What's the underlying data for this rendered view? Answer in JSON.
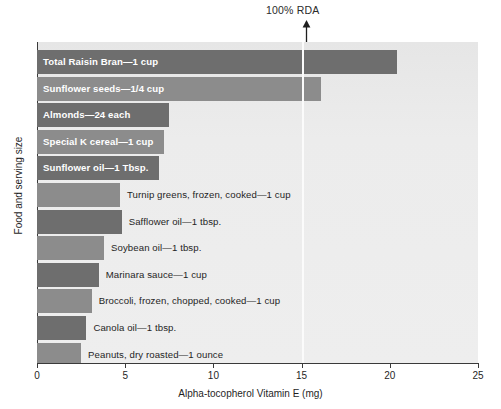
{
  "chart_data": {
    "type": "bar",
    "orientation": "horizontal",
    "title": "",
    "xlabel": "Alpha-tocopherol Vitamin E (mg)",
    "ylabel": "Food and serving size",
    "xlim": [
      0,
      25
    ],
    "xticks": [
      0,
      5,
      10,
      15,
      20,
      25
    ],
    "xtick_labels": [
      "0",
      "5",
      "10",
      "15",
      "20",
      "25"
    ],
    "grid": false,
    "legend": null,
    "annotations": [
      {
        "text": "100% RDA",
        "x": 15,
        "marker": "up-arrow",
        "line": "vertical-white-line-at-15mg"
      }
    ],
    "categories": [
      "Total Raisin Bran—1 cup",
      "Sunflower seeds—1/4 cup",
      "Almonds—24 each",
      "Special K cereal—1 cup",
      "Sunflower oil—1 Tbsp.",
      "Turnip greens, frozen, cooked—1 cup",
      "Safflower oil—1 tbsp.",
      "Soybean oil—1 tbsp.",
      "Marinara sauce—1 cup",
      "Broccoli, frozen, chopped, cooked—1 cup",
      "Canola oil—1 tbsp.",
      "Peanuts, dry roasted—1 ounce"
    ],
    "values": [
      20.4,
      16.1,
      7.5,
      7.2,
      6.9,
      4.7,
      4.8,
      3.8,
      3.5,
      3.1,
      2.8,
      2.5
    ]
  },
  "bars": [
    {
      "label": "Total Raisin Bran—1 cup",
      "value": 20.4,
      "shade": "dark",
      "label_position": "inside"
    },
    {
      "label": "Sunflower seeds—1/4 cup",
      "value": 16.1,
      "shade": "mid",
      "label_position": "inside"
    },
    {
      "label": "Almonds—24 each",
      "value": 7.5,
      "shade": "dark",
      "label_position": "inside"
    },
    {
      "label": "Special K cereal—1 cup",
      "value": 7.2,
      "shade": "mid",
      "label_position": "inside"
    },
    {
      "label": "Sunflower oil—1 Tbsp.",
      "value": 6.9,
      "shade": "dark",
      "label_position": "inside"
    },
    {
      "label": "Turnip greens, frozen, cooked—1 cup",
      "value": 4.7,
      "shade": "mid",
      "label_position": "outside"
    },
    {
      "label": "Safflower oil—1 tbsp.",
      "value": 4.8,
      "shade": "dark",
      "label_position": "outside"
    },
    {
      "label": "Soybean oil—1 tbsp.",
      "value": 3.8,
      "shade": "mid",
      "label_position": "outside"
    },
    {
      "label": "Marinara sauce—1 cup",
      "value": 3.5,
      "shade": "dark",
      "label_position": "outside"
    },
    {
      "label": "Broccoli, frozen, chopped, cooked—1 cup",
      "value": 3.1,
      "shade": "mid",
      "label_position": "outside"
    },
    {
      "label": "Canola oil—1 tbsp.",
      "value": 2.8,
      "shade": "dark",
      "label_position": "outside"
    },
    {
      "label": "Peanuts, dry roasted—1 ounce",
      "value": 2.5,
      "shade": "mid",
      "label_position": "outside"
    }
  ],
  "axes": {
    "x_label": "Alpha-tocopherol Vitamin E (mg)",
    "y_label": "Food and serving size",
    "x_ticks": [
      "0",
      "5",
      "10",
      "15",
      "20",
      "25"
    ]
  },
  "annotation": {
    "rda_text": "100% RDA",
    "rda_value": 15
  },
  "colors": {
    "bar_dark": "#6e6e6e",
    "bar_mid": "#8c8c8c",
    "plot_background": "#ebebeb",
    "rda_line": "#fbfbfb",
    "axis": "#3a3a3a",
    "inside_label_text": "#ffffff",
    "outside_label_text": "#1f1f1f"
  }
}
